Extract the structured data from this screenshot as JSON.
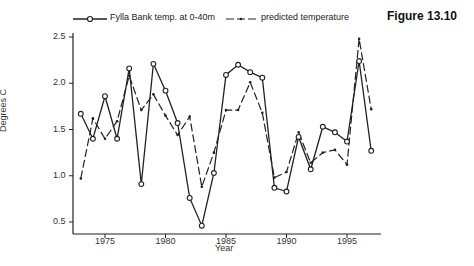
{
  "figure_title": "Figure 13.10",
  "chart_data": {
    "type": "line",
    "title": "Figure 13.10",
    "xlabel": "Year",
    "ylabel": "Degrees C",
    "xlim": [
      1972.3,
      1998
    ],
    "ylim": [
      0.37,
      2.6
    ],
    "x_ticks": [
      "1975",
      "1980",
      "1985",
      "1990",
      "1995"
    ],
    "y_ticks": [
      "0.5",
      "1.0",
      "1.5",
      "2.0",
      "2.5"
    ],
    "grid": false,
    "legend_position": "top",
    "x": [
      1973,
      1974,
      1975,
      1976,
      1977,
      1978,
      1979,
      1980,
      1981,
      1982,
      1983,
      1984,
      1985,
      1986,
      1987,
      1988,
      1989,
      1990,
      1991,
      1992,
      1993,
      1994,
      1995,
      1996,
      1997
    ],
    "series": [
      {
        "name": "Fylla Bank temp. at 0-40m",
        "style": "solid line, open circle markers",
        "values": [
          1.67,
          1.4,
          1.86,
          1.4,
          2.16,
          0.91,
          2.21,
          1.92,
          1.57,
          0.76,
          0.46,
          1.03,
          2.09,
          2.2,
          2.12,
          2.06,
          0.87,
          0.83,
          1.42,
          1.07,
          1.53,
          1.47,
          1.37,
          2.24,
          1.27
        ]
      },
      {
        "name": "predicted temperature",
        "style": "dashed line, small dot markers",
        "values": [
          0.97,
          1.62,
          1.4,
          1.59,
          2.08,
          1.71,
          1.88,
          1.65,
          1.44,
          1.64,
          0.88,
          1.25,
          1.71,
          1.71,
          2.01,
          1.68,
          0.98,
          1.04,
          1.47,
          1.14,
          1.25,
          1.28,
          1.12,
          2.48,
          1.72
        ]
      }
    ]
  },
  "legend": {
    "observed_label": "Fylla Bank temp. at 0-40m",
    "predicted_label": "predicted temperature"
  },
  "axes": {
    "xlabel": "Year",
    "ylabel": "Degrees C"
  }
}
